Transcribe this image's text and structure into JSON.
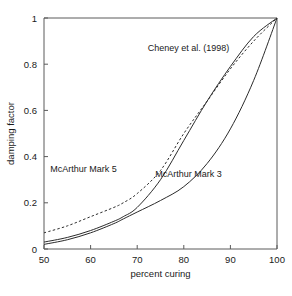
{
  "chart_data": {
    "type": "line",
    "title": "",
    "xlabel": "percent curing",
    "ylabel": "damping factor",
    "xlim": [
      50,
      100
    ],
    "ylim": [
      0,
      1
    ],
    "xticks": [
      50,
      60,
      70,
      80,
      90,
      100
    ],
    "xtick_labels": [
      "50",
      "60",
      "70",
      "80",
      "90",
      "100"
    ],
    "yticks": [
      0,
      0.2,
      0.4,
      0.6,
      0.8,
      1
    ],
    "ytick_labels": [
      "0",
      "0.2",
      "0.4",
      "0.6",
      "0.8",
      "1"
    ],
    "grid": false,
    "legend_position": "inline-annotations",
    "x": [
      50,
      55,
      60,
      65,
      67,
      70,
      75,
      80,
      85,
      90,
      95,
      100
    ],
    "series": [
      {
        "name": "Cheney et al. (1998)",
        "style": "solid",
        "values": [
          0.03,
          0.05,
          0.08,
          0.12,
          0.14,
          0.18,
          0.3,
          0.47,
          0.64,
          0.79,
          0.92,
          1.0
        ]
      },
      {
        "name": "McArthur Mark 5",
        "style": "dashed",
        "values": [
          0.07,
          0.1,
          0.14,
          0.18,
          0.2,
          0.24,
          0.34,
          0.5,
          0.64,
          0.78,
          0.9,
          1.0
        ]
      },
      {
        "name": "McArthur Mark 3",
        "style": "solid",
        "values": [
          0.02,
          0.04,
          0.07,
          0.11,
          0.13,
          0.16,
          0.21,
          0.27,
          0.37,
          0.52,
          0.73,
          1.0
        ]
      }
    ],
    "annotations": [
      {
        "text": "Cheney et al. (1998)",
        "x": 81,
        "y": 0.855
      },
      {
        "text": "McArthur Mark 5",
        "x": 58.5,
        "y": 0.335
      },
      {
        "text": "McArthur Mark 3",
        "x": 81,
        "y": 0.31
      }
    ]
  }
}
